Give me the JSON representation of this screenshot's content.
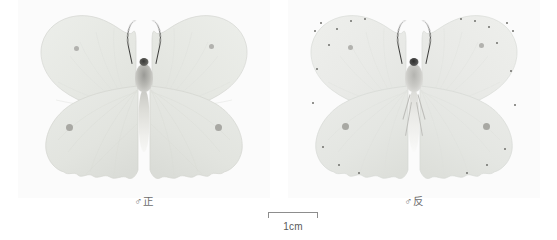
{
  "plate": {
    "width": 557,
    "height": 240,
    "background_color": "#ffffff",
    "panel_background_color": "#fbfbfb"
  },
  "specimens": [
    {
      "id": "specimen-dorsal",
      "label": "♂正",
      "view": "dorsal",
      "sex_symbol": "♂",
      "view_char": "正",
      "wing_color": "#e9ebe7",
      "wing_edge_color": "#d8dad5",
      "spot_color": "#a8a8a3",
      "body_color": "#b9b9b4",
      "forewing_spots": 2,
      "hindwing_spots": 2,
      "margin_dots": 0
    },
    {
      "id": "specimen-ventral",
      "label": "♂反",
      "view": "ventral",
      "sex_symbol": "♂",
      "view_char": "反",
      "wing_color": "#ebece9",
      "wing_edge_color": "#dcdeda",
      "spot_color": "#9e9e99",
      "body_color": "#c6c6c2",
      "forewing_spots": 2,
      "hindwing_spots": 2,
      "margin_dots": 22
    }
  ],
  "scale_bar": {
    "caption": "1cm",
    "length_px": 50,
    "line_color": "#8d8d8d",
    "text_color": "#595959"
  }
}
